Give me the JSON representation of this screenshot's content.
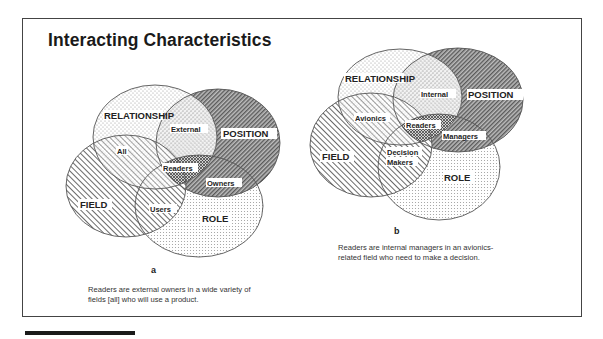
{
  "title": "Interacting Characteristics",
  "colors": {
    "outline": "#555555",
    "position_fill": "#8a8a8a",
    "field_hatch": "#777777",
    "relationship_fill": "#bdbdbd",
    "role_fill": "#c8c8c8",
    "frame": "#444444",
    "footer_bar": "#1a1a1a"
  },
  "panels": [
    {
      "letter": "a",
      "sets": {
        "relationship": "RELATIONSHIP",
        "position": "POSITION",
        "field": "FIELD",
        "role": "ROLE"
      },
      "regions": {
        "relationship_position": "External",
        "relationship_field": "All",
        "center": "Readers",
        "position_role": "Owners",
        "field_role": "Users"
      },
      "caption_lines": [
        "Readers are external owners in a wide variety of",
        "fields [all] who will use a product."
      ]
    },
    {
      "letter": "b",
      "sets": {
        "relationship": "RELATIONSHIP",
        "position": "POSITION",
        "field": "FIELD",
        "role": "ROLE"
      },
      "regions": {
        "relationship_position": "Internal",
        "relationship_field": "Avionics",
        "center": "Readers",
        "position_role": "Managers",
        "field_role_line1": "Decision",
        "field_role_line2": "Makers"
      },
      "caption_lines": [
        "Readers are internal managers in an avionics-",
        "related field who need to make a decision."
      ]
    }
  ]
}
